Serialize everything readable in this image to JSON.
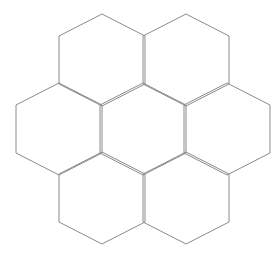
{
  "figure": {
    "kind": "line-drawing",
    "canvas": {
      "width": 279,
      "height": 258,
      "background_color": "#ffffff"
    },
    "style": {
      "stroke_color": "#8a8a8a",
      "stroke_width": 1,
      "fill_color": "none"
    },
    "hexagon_geometry": {
      "orientation": "pointy-top",
      "half_width": 43,
      "side_half_height": 24,
      "apex_extension": 22,
      "full_width": 86,
      "full_height": 92
    },
    "counts": {
      "total_hexagons": 7,
      "rows": 3,
      "row_counts": [
        2,
        3,
        2
      ]
    },
    "cells": [
      {
        "id": "hex-top-left",
        "row": 0,
        "col": 0,
        "cx": 102,
        "cy": 60,
        "label": "top left"
      },
      {
        "id": "hex-top-right",
        "row": 0,
        "col": 1,
        "cx": 186,
        "cy": 60,
        "label": "top right"
      },
      {
        "id": "hex-middle-left",
        "row": 1,
        "col": 0,
        "cx": 59,
        "cy": 129,
        "label": "middle left"
      },
      {
        "id": "hex-center",
        "row": 1,
        "col": 1,
        "cx": 143,
        "cy": 129,
        "label": "center"
      },
      {
        "id": "hex-middle-right",
        "row": 1,
        "col": 2,
        "cx": 227,
        "cy": 129,
        "label": "middle right"
      },
      {
        "id": "hex-bottom-left",
        "row": 2,
        "col": 0,
        "cx": 102,
        "cy": 198,
        "label": "bottom left"
      },
      {
        "id": "hex-bottom-right",
        "row": 2,
        "col": 1,
        "cx": 186,
        "cy": 198,
        "label": "bottom right"
      }
    ]
  }
}
